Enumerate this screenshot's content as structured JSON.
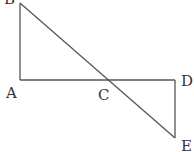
{
  "diagram": {
    "type": "geometry",
    "stroke_color": "#555555",
    "label_color": "#333333",
    "points": {
      "A": {
        "label": "A",
        "x": 20,
        "y": 80
      },
      "B": {
        "label": "B",
        "x": 20,
        "y": 3
      },
      "C": {
        "label": "C",
        "x": 108,
        "y": 80
      },
      "D": {
        "label": "D",
        "x": 175,
        "y": 80
      },
      "E": {
        "label": "E",
        "x": 175,
        "y": 138
      }
    },
    "segments": [
      "AB",
      "AD",
      "BE",
      "DE"
    ]
  }
}
